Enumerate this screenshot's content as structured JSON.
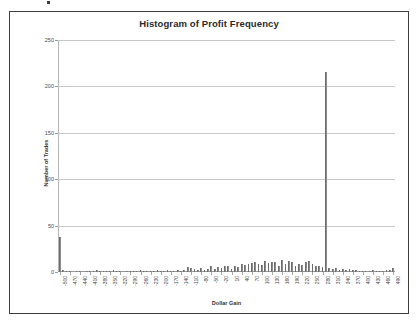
{
  "chart_data": {
    "type": "bar",
    "title": "Histogram of Profit Frequency",
    "xlabel": "Dollar Gain",
    "ylabel": "Number of Trades",
    "ylim": [
      0,
      250
    ],
    "yticks": [
      0,
      50,
      100,
      150,
      200,
      250
    ],
    "grid": true,
    "legend": null,
    "xtick_step": 30,
    "xtick_labels": [
      "-500",
      "-470",
      "-440",
      "-410",
      "-380",
      "-350",
      "-320",
      "-290",
      "-260",
      "-230",
      "-200",
      "-170",
      "-140",
      "-110",
      "-80",
      "-50",
      "-20",
      "10",
      "40",
      "70",
      "100",
      "130",
      "160",
      "190",
      "220",
      "250",
      "280",
      "310",
      "340",
      "370",
      "400",
      "430",
      "460",
      "490"
    ],
    "categories": [
      "-500",
      "-490",
      "-480",
      "-470",
      "-460",
      "-450",
      "-440",
      "-430",
      "-420",
      "-410",
      "-400",
      "-390",
      "-380",
      "-370",
      "-360",
      "-350",
      "-340",
      "-330",
      "-320",
      "-310",
      "-300",
      "-290",
      "-280",
      "-270",
      "-260",
      "-250",
      "-240",
      "-230",
      "-220",
      "-210",
      "-200",
      "-190",
      "-180",
      "-170",
      "-160",
      "-150",
      "-140",
      "-130",
      "-120",
      "-110",
      "-100",
      "-90",
      "-80",
      "-70",
      "-60",
      "-50",
      "-40",
      "-30",
      "-20",
      "-10",
      "0",
      "10",
      "20",
      "30",
      "40",
      "50",
      "60",
      "70",
      "80",
      "90",
      "100",
      "110",
      "120",
      "130",
      "140",
      "150",
      "160",
      "170",
      "180",
      "190",
      "200",
      "210",
      "220",
      "230",
      "240",
      "250",
      "260",
      "270",
      "280",
      "290",
      "300",
      "310",
      "320",
      "330",
      "340",
      "350",
      "360",
      "370",
      "380",
      "390",
      "400",
      "410",
      "420",
      "430",
      "440",
      "450",
      "460",
      "470",
      "480",
      "490"
    ],
    "values": [
      38,
      2,
      1,
      1,
      0,
      1,
      1,
      0,
      1,
      1,
      1,
      2,
      1,
      1,
      1,
      1,
      2,
      1,
      1,
      0,
      1,
      1,
      1,
      1,
      2,
      1,
      1,
      1,
      1,
      2,
      1,
      1,
      2,
      1,
      1,
      2,
      1,
      2,
      5,
      4,
      3,
      2,
      4,
      2,
      3,
      6,
      3,
      5,
      4,
      7,
      6,
      3,
      7,
      5,
      9,
      8,
      9,
      10,
      11,
      9,
      8,
      12,
      10,
      11,
      11,
      7,
      13,
      9,
      12,
      11,
      6,
      9,
      8,
      11,
      12,
      9,
      7,
      6,
      5,
      215,
      4,
      3,
      4,
      2,
      3,
      2,
      3,
      2,
      2,
      1,
      1,
      1,
      1,
      2,
      1,
      1,
      1,
      2,
      2,
      4
    ]
  }
}
